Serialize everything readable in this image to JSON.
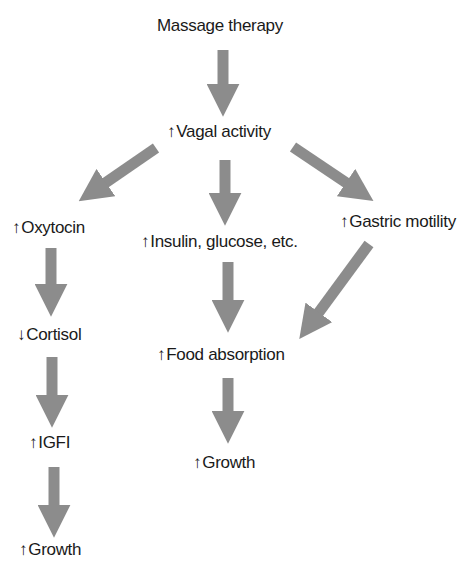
{
  "diagram": {
    "arrow_color": "#8c8c8c",
    "nodes": {
      "massage": {
        "prefix": "",
        "label": "Massage therapy"
      },
      "vagal": {
        "prefix": "↑",
        "label": "Vagal activity"
      },
      "oxytocin": {
        "prefix": "↑",
        "label": "Oxytocin"
      },
      "insulin": {
        "prefix": "↑",
        "label": "Insulin, glucose, etc."
      },
      "gastric": {
        "prefix": "↑",
        "label": "Gastric motility"
      },
      "cortisol": {
        "prefix": "↓",
        "label": "Cortisol"
      },
      "food": {
        "prefix": "↑",
        "label": "Food absorption"
      },
      "igfi": {
        "prefix": "↑",
        "label": "IGFI"
      },
      "growth_mid": {
        "prefix": "↑",
        "label": "Growth"
      },
      "growth_left": {
        "prefix": "↑",
        "label": "Growth"
      }
    },
    "edges": [
      {
        "from": "Massage therapy",
        "to": "Vagal activity"
      },
      {
        "from": "Vagal activity",
        "to": "Oxytocin"
      },
      {
        "from": "Vagal activity",
        "to": "Insulin, glucose, etc."
      },
      {
        "from": "Vagal activity",
        "to": "Gastric motility"
      },
      {
        "from": "Oxytocin",
        "to": "Cortisol"
      },
      {
        "from": "Cortisol",
        "to": "IGFI"
      },
      {
        "from": "IGFI",
        "to": "Growth"
      },
      {
        "from": "Insulin, glucose, etc.",
        "to": "Food absorption"
      },
      {
        "from": "Gastric motility",
        "to": "Food absorption"
      },
      {
        "from": "Food absorption",
        "to": "Growth"
      }
    ]
  }
}
